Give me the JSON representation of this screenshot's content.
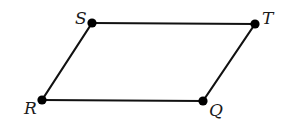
{
  "diagram": {
    "type": "parallelogram",
    "colors": {
      "edge": "#111111",
      "vertex": "#000000",
      "label": "#1a1a1a",
      "background": "#ffffff"
    },
    "vertices": {
      "S": {
        "label": "S",
        "x": 92,
        "y": 23,
        "label_x": 75,
        "label_y": 24
      },
      "T": {
        "label": "T",
        "x": 255,
        "y": 24,
        "label_x": 262,
        "label_y": 24
      },
      "R": {
        "label": "R",
        "x": 42,
        "y": 100,
        "label_x": 24,
        "label_y": 114
      },
      "Q": {
        "label": "Q",
        "x": 203,
        "y": 101,
        "label_x": 209,
        "label_y": 116
      }
    },
    "edges": [
      {
        "from": "S",
        "to": "T"
      },
      {
        "from": "T",
        "to": "Q"
      },
      {
        "from": "Q",
        "to": "R"
      },
      {
        "from": "R",
        "to": "S"
      }
    ]
  }
}
